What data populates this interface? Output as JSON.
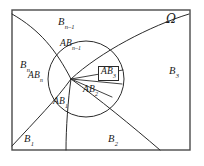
{
  "figure": {
    "universe_label": "Ω",
    "stroke_color": "#2b2b2b",
    "frame_color": "#4a4a4a",
    "background": "#ffffff"
  },
  "frame": {
    "x": 12,
    "y": 10,
    "width": 178,
    "height": 140
  },
  "region_labels": [
    {
      "name": "B_n_minus_1",
      "base": "B",
      "sub": "n–1",
      "x": 58,
      "y": 17
    },
    {
      "name": "B_n",
      "base": "B",
      "sub": "n",
      "x": 20,
      "y": 60
    },
    {
      "name": "B_1",
      "base": "B",
      "sub": "1",
      "x": 24,
      "y": 134
    },
    {
      "name": "B_2",
      "base": "B",
      "sub": "2",
      "x": 108,
      "y": 134
    },
    {
      "name": "B_3",
      "base": "B",
      "sub": "3",
      "x": 169,
      "y": 66
    }
  ],
  "intersection_labels": [
    {
      "name": "AB_n_minus_1",
      "base": "AB",
      "sub": "n–1",
      "x": 60,
      "y": 39,
      "boxed": false
    },
    {
      "name": "AB_n",
      "base": "AB",
      "sub": "n",
      "x": 28,
      "y": 71,
      "boxed": false
    },
    {
      "name": "AB_1",
      "base": "AB",
      "sub": "1",
      "x": 53,
      "y": 97,
      "boxed": false
    },
    {
      "name": "AB_2",
      "base": "AB",
      "sub": "2",
      "x": 83,
      "y": 85,
      "boxed": false
    },
    {
      "name": "AB_3",
      "base": "AB",
      "sub": "3",
      "x": 98,
      "y": 66,
      "boxed": true
    }
  ],
  "geometry": {
    "circle_A": {
      "cx": 86,
      "cy": 79,
      "r": 38
    },
    "vertex": {
      "x": 71,
      "y": 79
    },
    "boundary_curves": [
      {
        "name": "curve-upper-left",
        "d": "M 12 14 C 40 30, 56 50, 71 79"
      },
      {
        "name": "curve-lower-left",
        "d": "M 12 146 C 36 120, 56 100, 71 79"
      },
      {
        "name": "curve-lower-mid",
        "d": "M 66 150 C 66 128, 68 100, 71 79"
      },
      {
        "name": "curve-upper-right",
        "d": "M 189 14 C 150 26, 100 52, 71 79"
      },
      {
        "name": "curve-lower-right",
        "d": "M 160 150 C 132 126, 98 98, 71 79"
      }
    ],
    "inner_chords": [
      {
        "name": "chord-to-AB3-upper",
        "d": "M 71 79 L 123 70"
      },
      {
        "name": "chord-to-AB3-lower",
        "d": "M 71 79 L 122 84"
      },
      {
        "name": "chord-to-AB2",
        "d": "M 71 79 L 112 97"
      }
    ]
  }
}
